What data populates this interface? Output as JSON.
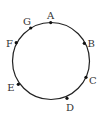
{
  "diagram": {
    "type": "circle-with-points",
    "stroke_color": "#222222",
    "point_color": "#111111",
    "label_color": "#333333",
    "points": [
      {
        "id": "A",
        "label": "A"
      },
      {
        "id": "B",
        "label": "B"
      },
      {
        "id": "C",
        "label": "C"
      },
      {
        "id": "D",
        "label": "D"
      },
      {
        "id": "E",
        "label": "E"
      },
      {
        "id": "F",
        "label": "F"
      },
      {
        "id": "G",
        "label": "G"
      }
    ]
  }
}
